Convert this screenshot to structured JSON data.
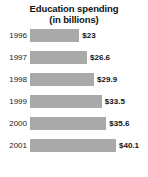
{
  "chart_data": {
    "type": "bar",
    "orientation": "horizontal",
    "title": "Education spending (in billions)",
    "title_lines": [
      "Education spending",
      "(in billions)"
    ],
    "categories": [
      "1996",
      "1997",
      "1998",
      "1999",
      "2000",
      "2001"
    ],
    "values": [
      23,
      26.6,
      29.9,
      33.5,
      35.6,
      40.1
    ],
    "value_labels": [
      "$23",
      "$26.6",
      "$29.9",
      "$33.5",
      "$35.6",
      "$40.1"
    ],
    "xlabel": "",
    "ylabel": "",
    "xlim": [
      0,
      40.1
    ],
    "grid": false,
    "legend": false,
    "bar_color": "#a9a9a9",
    "background_color": "#ffffff",
    "text_color": "#111111",
    "rows": [
      {
        "category": "1996",
        "value": 23,
        "value_label": "$23",
        "bar_pct": 57.4
      },
      {
        "category": "1997",
        "value": 26.6,
        "value_label": "$26.6",
        "bar_pct": 66.3
      },
      {
        "category": "1998",
        "value": 29.9,
        "value_label": "$29.9",
        "bar_pct": 74.6
      },
      {
        "category": "1999",
        "value": 33.5,
        "value_label": "$33.5",
        "bar_pct": 83.5
      },
      {
        "category": "2000",
        "value": 35.6,
        "value_label": "$35.6",
        "bar_pct": 88.8
      },
      {
        "category": "2001",
        "value": 40.1,
        "value_label": "$40.1",
        "bar_pct": 100.0
      }
    ]
  }
}
